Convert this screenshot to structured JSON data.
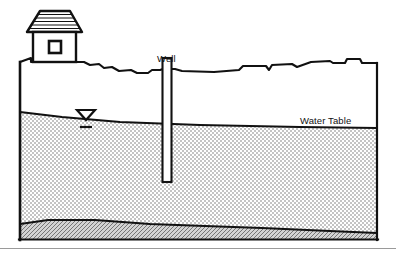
{
  "figure": {
    "background_color": "#ffffff",
    "line_color": "#111111",
    "saturated_zone_color": "#d9d9d9",
    "bedrock_color": "#b0b0b0",
    "width": 396,
    "height": 253
  },
  "labels": {
    "well": "Well",
    "water_table": "Water Table"
  },
  "elements": {
    "house_name": "house",
    "roof_name": "house-roof",
    "window_name": "house-window",
    "well_name": "well-shaft",
    "water_table_symbol_name": "water-table-triangle-symbol",
    "ground_surface_name": "ground-surface-line",
    "saturated_zone_name": "saturated-zone",
    "bedrock_name": "bedrock-layer",
    "baseline_name": "bottom-separator-line"
  },
  "geometry": {
    "frame_left": 18,
    "frame_right": 379,
    "frame_bottom": 241,
    "ground_surface_y_left": 62,
    "ground_surface_y_right": 63,
    "water_table_y_left": 112,
    "water_table_y_right": 127,
    "well_x_center": 167,
    "well_top_y": 58,
    "well_bottom_y": 181,
    "well_width": 9,
    "bedrock_top_y_left": 222,
    "bedrock_top_y_right": 232
  }
}
